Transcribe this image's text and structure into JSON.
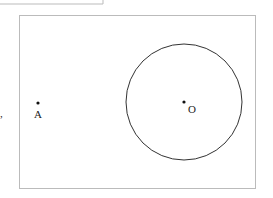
{
  "diagram": {
    "points": [
      {
        "label": "A",
        "x": 38,
        "y": 103
      },
      {
        "label": "O",
        "x": 184,
        "y": 102
      }
    ],
    "circle": {
      "center": "O",
      "radius": 58
    },
    "punctuation": ","
  }
}
